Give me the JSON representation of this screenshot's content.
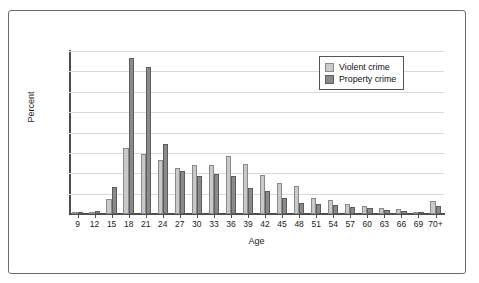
{
  "chart_data": {
    "type": "bar",
    "title": "",
    "xlabel": "Age",
    "ylabel": "Percent",
    "grid": true,
    "legend_position": "top-right",
    "ylim": [
      0,
      16
    ],
    "gridline_count": 8,
    "y_tick_labels": [],
    "categories": [
      "9",
      "12",
      "15",
      "18",
      "21",
      "24",
      "27",
      "30",
      "33",
      "36",
      "39",
      "42",
      "45",
      "48",
      "51",
      "54",
      "57",
      "60",
      "63",
      "66",
      "69",
      "70+"
    ],
    "series": [
      {
        "name": "Violent crime",
        "color": "#c9c9c9",
        "values": [
          0.0,
          0.15,
          1.45,
          6.45,
          5.9,
          5.35,
          4.55,
          4.85,
          4.8,
          5.65,
          4.95,
          3.85,
          3.0,
          2.75,
          1.55,
          1.35,
          1.0,
          0.8,
          0.55,
          0.45,
          0.2,
          1.25
        ]
      },
      {
        "name": "Property crime",
        "color": "#8a8a8a",
        "values": [
          0.1,
          0.3,
          2.65,
          15.3,
          14.4,
          6.85,
          4.25,
          3.7,
          3.95,
          3.7,
          2.6,
          2.25,
          1.6,
          1.05,
          0.95,
          0.85,
          0.7,
          0.6,
          0.4,
          0.3,
          0.2,
          0.75
        ]
      }
    ]
  },
  "legend": {
    "items": [
      {
        "label": "Violent crime",
        "swatch": "violent"
      },
      {
        "label": "Property crime",
        "swatch": "property"
      }
    ]
  }
}
